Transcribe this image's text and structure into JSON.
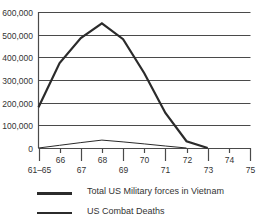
{
  "chart_data": {
    "type": "line",
    "title": "",
    "xlabel": "",
    "ylabel": "",
    "categories": [
      "61–65",
      "66",
      "67",
      "68",
      "69",
      "70",
      "71",
      "72",
      "73",
      "74",
      "75"
    ],
    "x_tick_labels_upper": [
      "66",
      "68",
      "70",
      "72",
      "74"
    ],
    "x_tick_labels_lower": [
      "61–65",
      "67",
      "69",
      "71",
      "73",
      "75"
    ],
    "y_ticks": [
      0,
      100000,
      200000,
      300000,
      400000,
      500000,
      600000
    ],
    "y_tick_labels": [
      "0",
      "100,000",
      "200,000",
      "300,000",
      "400,000",
      "500,000",
      "600,000"
    ],
    "ylim": [
      0,
      600000
    ],
    "grid": "horizontal",
    "legend_position": "bottom",
    "series": [
      {
        "name": "Total US Military forces in Vietnam",
        "style": "thick",
        "color": "#2b2b2b",
        "values": [
          180000,
          375000,
          485000,
          550000,
          480000,
          330000,
          155000,
          30000,
          0,
          null,
          null
        ]
      },
      {
        "name": "US Combat Deaths",
        "style": "thin",
        "color": "#2b2b2b",
        "values": [
          0,
          12000,
          24000,
          35000,
          27000,
          18000,
          9000,
          0,
          null,
          null,
          null
        ]
      }
    ]
  },
  "legend": {
    "items": [
      {
        "label": "Total US Military forces in Vietnam"
      },
      {
        "label": "US Combat Deaths"
      }
    ]
  }
}
